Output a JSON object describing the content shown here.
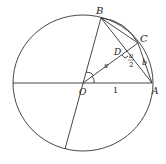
{
  "diagram": {
    "type": "geometry",
    "stroke_color": "#333333",
    "points": {
      "O": {
        "label": "O"
      },
      "A": {
        "label": "A"
      },
      "B": {
        "label": "B"
      },
      "C": {
        "label": "C"
      },
      "D": {
        "label": "D"
      }
    },
    "segment_labels": {
      "OA": "1",
      "OD": "s",
      "DA_num": "a",
      "DA_den": "2",
      "CA": "b"
    }
  }
}
